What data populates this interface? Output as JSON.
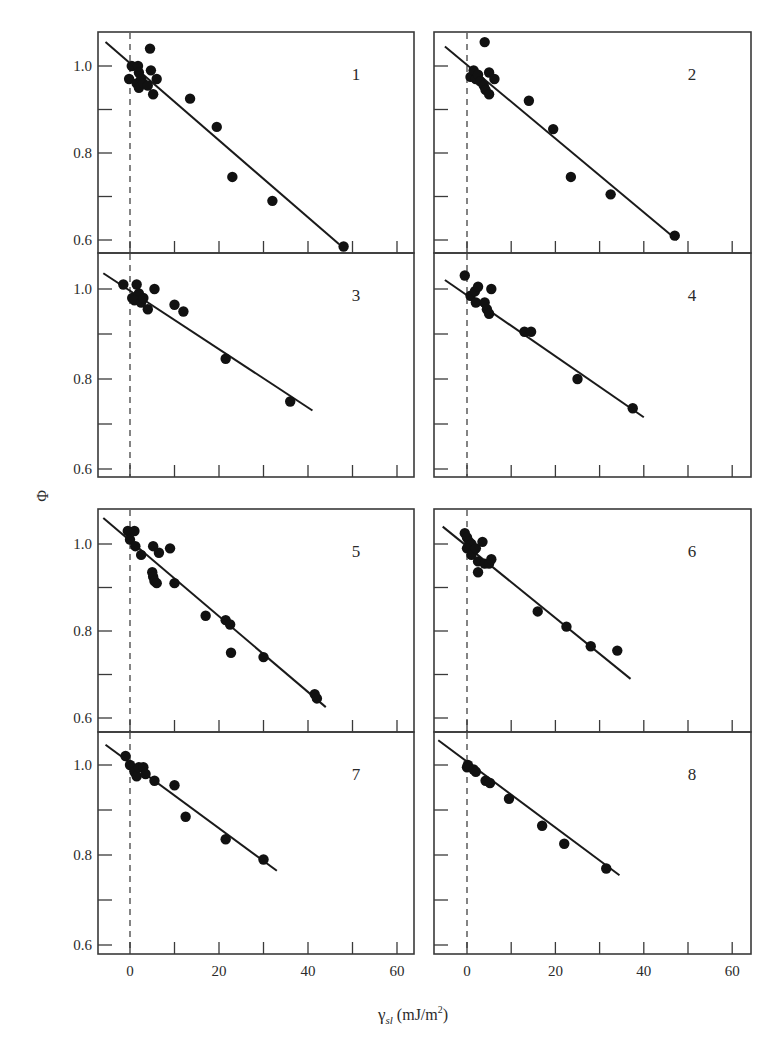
{
  "figure": {
    "y_axis_title": "Φ",
    "x_axis_title_main": "γ",
    "x_axis_title_sub": "sl",
    "x_axis_title_unit": " (mJ/m",
    "x_axis_title_sup": "2",
    "x_axis_title_close": ")",
    "x_tick_labels": [
      "0",
      "20",
      "40",
      "60"
    ],
    "y_tick_labels": [
      "1.0",
      "0.8",
      "0.6"
    ]
  },
  "chart_data": {
    "type": "scatter",
    "title": "",
    "xlabel": "γsl (mJ/m2)",
    "ylabel": "Φ",
    "xlim": [
      -7,
      64
    ],
    "ylim": [
      0.58,
      1.08
    ],
    "x_ticks": [
      0,
      10,
      20,
      30,
      40,
      50,
      60
    ],
    "x_tick_labels": [
      "0",
      "20",
      "40",
      "60"
    ],
    "y_ticks": [
      0.6,
      0.7,
      0.8,
      0.9,
      1.0
    ],
    "y_tick_labels": [
      "0.6",
      "0.8",
      "1.0"
    ],
    "grid": false,
    "reference_line": {
      "x": 0,
      "style": "dashed"
    },
    "layout": "4 rows x 2 columns, shared axes",
    "panels": [
      {
        "label": "1",
        "points": [
          [
            0.4,
            1.0
          ],
          [
            -0.2,
            0.97
          ],
          [
            1.8,
            1.0
          ],
          [
            2.0,
            0.985
          ],
          [
            1.5,
            0.96
          ],
          [
            2.5,
            0.97
          ],
          [
            2.0,
            0.95
          ],
          [
            3.0,
            0.96
          ],
          [
            4.0,
            0.955
          ],
          [
            4.5,
            1.04
          ],
          [
            4.7,
            0.99
          ],
          [
            6.0,
            0.97
          ],
          [
            5.2,
            0.935
          ],
          [
            13.5,
            0.925
          ],
          [
            19.5,
            0.86
          ],
          [
            23.0,
            0.745
          ],
          [
            32.0,
            0.69
          ],
          [
            48.0,
            0.585
          ]
        ],
        "fit": [
          [
            -5.5,
            1.055
          ],
          [
            47,
            0.59
          ]
        ]
      },
      {
        "label": "2",
        "points": [
          [
            0.8,
            0.975
          ],
          [
            1.5,
            0.99
          ],
          [
            2.0,
            0.97
          ],
          [
            2.5,
            0.98
          ],
          [
            3.0,
            0.965
          ],
          [
            3.8,
            0.955
          ],
          [
            4.2,
            0.945
          ],
          [
            5.0,
            0.935
          ],
          [
            4.0,
            1.055
          ],
          [
            5.0,
            0.985
          ],
          [
            6.2,
            0.97
          ],
          [
            14.0,
            0.92
          ],
          [
            19.5,
            0.855
          ],
          [
            23.5,
            0.745
          ],
          [
            32.5,
            0.705
          ],
          [
            47.0,
            0.61
          ]
        ],
        "fit": [
          [
            -5,
            1.045
          ],
          [
            47.5,
            0.6
          ]
        ]
      },
      {
        "label": "3",
        "points": [
          [
            -1.5,
            1.01
          ],
          [
            0.5,
            0.98
          ],
          [
            1.5,
            1.01
          ],
          [
            2.0,
            0.99
          ],
          [
            1.0,
            0.975
          ],
          [
            2.5,
            0.97
          ],
          [
            3.0,
            0.98
          ],
          [
            4.0,
            0.955
          ],
          [
            5.5,
            1.0
          ],
          [
            10.0,
            0.965
          ],
          [
            12.0,
            0.95
          ],
          [
            21.5,
            0.845
          ],
          [
            36.0,
            0.75
          ]
        ],
        "fit": [
          [
            -6,
            1.035
          ],
          [
            41,
            0.73
          ]
        ]
      },
      {
        "label": "4",
        "points": [
          [
            -0.5,
            1.03
          ],
          [
            0.8,
            0.985
          ],
          [
            1.8,
            0.995
          ],
          [
            2.5,
            1.005
          ],
          [
            2.0,
            0.97
          ],
          [
            4.0,
            0.97
          ],
          [
            4.5,
            0.955
          ],
          [
            5.0,
            0.945
          ],
          [
            5.5,
            1.0
          ],
          [
            13.0,
            0.905
          ],
          [
            14.5,
            0.905
          ],
          [
            25.0,
            0.8
          ],
          [
            37.5,
            0.735
          ]
        ],
        "fit": [
          [
            -5,
            1.02
          ],
          [
            40,
            0.715
          ]
        ]
      },
      {
        "label": "5",
        "points": [
          [
            -0.5,
            1.03
          ],
          [
            0.0,
            1.01
          ],
          [
            1.0,
            1.03
          ],
          [
            1.2,
            0.995
          ],
          [
            2.5,
            0.975
          ],
          [
            5.0,
            0.935
          ],
          [
            5.2,
            0.925
          ],
          [
            5.5,
            0.915
          ],
          [
            6.0,
            0.91
          ],
          [
            5.2,
            0.995
          ],
          [
            6.5,
            0.98
          ],
          [
            9.0,
            0.99
          ],
          [
            10.0,
            0.91
          ],
          [
            17.0,
            0.835
          ],
          [
            21.5,
            0.825
          ],
          [
            22.5,
            0.815
          ],
          [
            22.7,
            0.75
          ],
          [
            30.0,
            0.74
          ],
          [
            41.5,
            0.655
          ],
          [
            42.0,
            0.645
          ]
        ],
        "fit": [
          [
            -6,
            1.06
          ],
          [
            44,
            0.625
          ]
        ]
      },
      {
        "label": "6",
        "points": [
          [
            -0.5,
            1.025
          ],
          [
            0.0,
            1.015
          ],
          [
            0.5,
            1.005
          ],
          [
            1.0,
            1.0
          ],
          [
            0.0,
            0.99
          ],
          [
            1.5,
            0.985
          ],
          [
            1.0,
            0.975
          ],
          [
            2.0,
            0.99
          ],
          [
            2.5,
            0.96
          ],
          [
            3.5,
            1.005
          ],
          [
            4.0,
            0.955
          ],
          [
            5.0,
            0.955
          ],
          [
            5.5,
            0.965
          ],
          [
            2.5,
            0.935
          ],
          [
            16.0,
            0.845
          ],
          [
            22.5,
            0.81
          ],
          [
            28.0,
            0.765
          ],
          [
            34.0,
            0.755
          ]
        ],
        "fit": [
          [
            -5.5,
            1.04
          ],
          [
            37,
            0.69
          ]
        ]
      },
      {
        "label": "7",
        "points": [
          [
            -1.0,
            1.02
          ],
          [
            0.0,
            1.0
          ],
          [
            1.0,
            0.985
          ],
          [
            1.5,
            0.975
          ],
          [
            2.0,
            0.995
          ],
          [
            3.0,
            0.995
          ],
          [
            3.5,
            0.98
          ],
          [
            5.5,
            0.965
          ],
          [
            10.0,
            0.955
          ],
          [
            12.5,
            0.885
          ],
          [
            21.5,
            0.835
          ],
          [
            30.0,
            0.79
          ]
        ],
        "fit": [
          [
            -5.5,
            1.045
          ],
          [
            33,
            0.765
          ]
        ]
      },
      {
        "label": "8",
        "points": [
          [
            0.0,
            0.995
          ],
          [
            0.2,
            1.0
          ],
          [
            1.5,
            0.99
          ],
          [
            2.0,
            0.985
          ],
          [
            4.2,
            0.965
          ],
          [
            5.2,
            0.96
          ],
          [
            9.5,
            0.925
          ],
          [
            17.0,
            0.865
          ],
          [
            22.0,
            0.825
          ],
          [
            31.5,
            0.77
          ]
        ],
        "fit": [
          [
            -6.5,
            1.055
          ],
          [
            34.5,
            0.755
          ]
        ]
      }
    ]
  }
}
